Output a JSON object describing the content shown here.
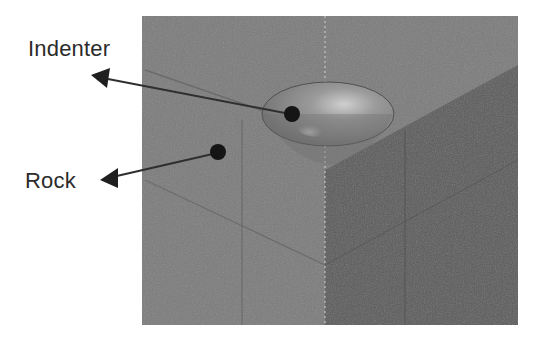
{
  "figure": {
    "labels": {
      "indenter": "Indenter",
      "rock": "Rock"
    },
    "colors": {
      "background": "#ffffff",
      "rock_front_face": "#7d7d7d",
      "rock_side_face": "#5f5f5f",
      "indenter_body": "#8a8a8a",
      "indenter_highlight": "#c8c8c8",
      "marker_dot": "#151515",
      "arrow": "#2f2f2f",
      "label_text": "#2b2b2b"
    }
  }
}
